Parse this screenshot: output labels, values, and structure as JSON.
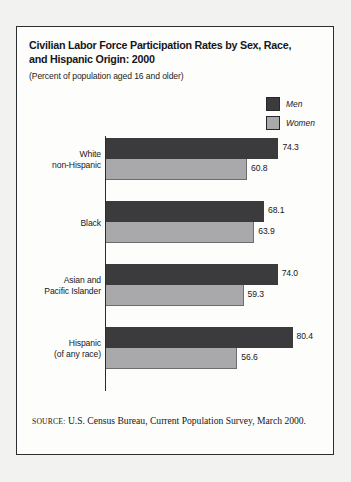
{
  "figure": {
    "title": "Civilian Labor Force Participation Rates by Sex, Race, and Hispanic Origin: 2000",
    "subtitle": "(Percent of population aged 16 and older)",
    "source_label": "SOURCE:",
    "source_text": " U.S. Census Bureau, Current Population Survey, March 2000."
  },
  "legend": {
    "items": [
      {
        "label": "Men",
        "color": "#3b3b3d",
        "swatch_name": "legend-swatch-men"
      },
      {
        "label": "Women",
        "color": "#a9a9ab",
        "swatch_name": "legend-swatch-women"
      }
    ]
  },
  "chart_data": {
    "type": "bar",
    "orientation": "horizontal",
    "title": "Civilian Labor Force Participation Rates by Sex, Race, and Hispanic Origin: 2000",
    "subtitle": "(Percent of population aged 16 and older)",
    "xlabel": "",
    "ylabel": "",
    "xlim": [
      0,
      100
    ],
    "grid": false,
    "legend_position": "top-right",
    "categories": [
      "White non-Hispanic",
      "Black",
      "Asian and Pacific Islander",
      "Hispanic (of any race)"
    ],
    "category_lines": [
      [
        "White",
        "non-Hispanic"
      ],
      [
        "Black"
      ],
      [
        "Asian and",
        "Pacific Islander"
      ],
      [
        "Hispanic",
        "(of any race)"
      ]
    ],
    "series": [
      {
        "name": "Men",
        "color": "#3b3b3d",
        "values": [
          74.3,
          68.1,
          74.0,
          80.4
        ]
      },
      {
        "name": "Women",
        "color": "#a9a9ab",
        "values": [
          60.8,
          63.9,
          59.3,
          56.6
        ]
      }
    ],
    "value_labels": {
      "men": [
        "74.3",
        "68.1",
        "74.0",
        "80.4"
      ],
      "women": [
        "60.8",
        "63.9",
        "59.3",
        "56.6"
      ]
    }
  }
}
